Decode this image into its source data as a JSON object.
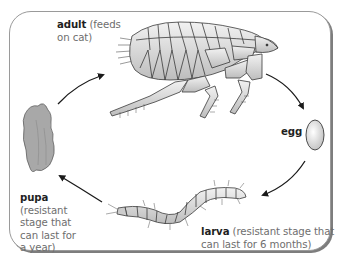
{
  "diagram": {
    "stages": [
      {
        "id": "adult",
        "name": "adult",
        "note": "(feeds on cat)",
        "note_lines": [
          "(feeds",
          "on cat)"
        ]
      },
      {
        "id": "egg",
        "name": "egg",
        "note": ""
      },
      {
        "id": "larva",
        "name": "larva",
        "note": "(resistant stage that can last for 6 months)",
        "note_lines": [
          "(resistant stage that",
          "can last for 6 months)"
        ]
      },
      {
        "id": "pupa",
        "name": "pupa",
        "note": "(resistant stage that can last for a year)",
        "note_lines": [
          "(resistant",
          "stage that",
          "can last for",
          "a year)"
        ]
      }
    ],
    "cycle_order": [
      "adult",
      "egg",
      "larva",
      "pupa",
      "adult"
    ],
    "colors": {
      "frame_border": "#9a9a9a",
      "frame_shadow": "#7d7d7d",
      "label_bold": "#1f1f1f",
      "label_note": "#6e6e6e",
      "arrow": "#1a1a1a",
      "insect_fill": "#d4d4d4",
      "insect_stroke": "#3a3a3a",
      "pupa_fill": "#a8a8a8"
    }
  }
}
